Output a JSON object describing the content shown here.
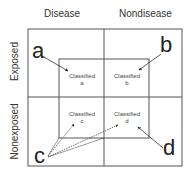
{
  "columns": {
    "disease": "Disease",
    "nondisease": "Nondisease"
  },
  "rows": {
    "exposed": "Exposed",
    "nonexposed": "Nonexposed"
  },
  "cells": {
    "a": {
      "letter": "a",
      "classified_label": "Classified",
      "classified_letter": "a"
    },
    "b": {
      "letter": "b",
      "classified_label": "Classified",
      "classified_letter": "b"
    },
    "c": {
      "letter": "c",
      "classified_label": "Classified",
      "classified_letter": "c"
    },
    "d": {
      "letter": "d",
      "classified_label": "Classified",
      "classified_letter": "d"
    }
  },
  "colors": {
    "line": "#555555",
    "text": "#222222"
  }
}
